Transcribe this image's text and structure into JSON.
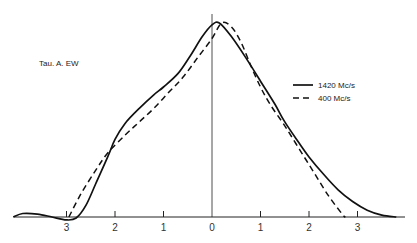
{
  "chart_data": {
    "type": "line",
    "title": "",
    "annotation": "Tau. A. EW",
    "xlabel": "",
    "ylabel": "",
    "grid": false,
    "legend_position": "right",
    "xlim": [
      -4.1,
      3.9
    ],
    "ylim": [
      -0.02,
      1.0
    ],
    "x_ticks": [
      {
        "value": -3,
        "label": "3"
      },
      {
        "value": -2,
        "label": "2"
      },
      {
        "value": -1,
        "label": "1"
      },
      {
        "value": 0,
        "label": "0"
      },
      {
        "value": 1,
        "label": "1"
      },
      {
        "value": 2,
        "label": "2"
      },
      {
        "value": 3,
        "label": "3"
      }
    ],
    "series": [
      {
        "name": "1420 Mc/s",
        "style": "solid",
        "x": [
          -4.1,
          -3.9,
          -3.6,
          -3.3,
          -3.0,
          -2.8,
          -2.6,
          -2.4,
          -2.15,
          -2.0,
          -1.8,
          -1.5,
          -1.2,
          -1.0,
          -0.7,
          -0.45,
          -0.2,
          0.0,
          0.15,
          0.4,
          0.7,
          1.0,
          1.3,
          1.5,
          1.8,
          2.0,
          2.3,
          2.6,
          2.9,
          3.2,
          3.5,
          3.8
        ],
        "y": [
          0.0,
          0.018,
          0.015,
          0.0,
          -0.015,
          -0.005,
          0.06,
          0.17,
          0.31,
          0.4,
          0.48,
          0.56,
          0.63,
          0.67,
          0.74,
          0.83,
          0.93,
          0.99,
          1.0,
          0.93,
          0.82,
          0.7,
          0.58,
          0.49,
          0.38,
          0.31,
          0.22,
          0.14,
          0.08,
          0.035,
          0.01,
          0.0
        ]
      },
      {
        "name": "400 Mc/s",
        "style": "dashed",
        "x": [
          -2.95,
          -2.7,
          -2.4,
          -2.15,
          -1.8,
          -1.5,
          -1.2,
          -0.9,
          -0.6,
          -0.3,
          0.0,
          0.2,
          0.4,
          0.6,
          0.8,
          1.0,
          1.2,
          1.5,
          1.8,
          2.1,
          2.4,
          2.7,
          2.75
        ],
        "y": [
          0.0,
          0.12,
          0.24,
          0.33,
          0.42,
          0.49,
          0.56,
          0.64,
          0.72,
          0.82,
          0.92,
          1.0,
          0.98,
          0.9,
          0.78,
          0.67,
          0.58,
          0.47,
          0.35,
          0.23,
          0.11,
          0.01,
          0.0
        ]
      }
    ]
  }
}
